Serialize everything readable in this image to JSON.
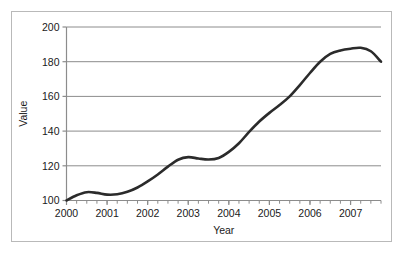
{
  "chart_data": {
    "type": "line",
    "title": "",
    "xlabel": "Year",
    "ylabel": "Value",
    "xlim": [
      2000,
      2007.75
    ],
    "ylim": [
      100,
      200
    ],
    "grid": true,
    "legend": false,
    "line_color": "#2b2b2b",
    "grid_color": "#8c8c8c",
    "axis_color": "#8c8c8c",
    "frame_color": "#b9b9b9",
    "background": "#ffffff",
    "y_ticks": [
      100,
      120,
      140,
      160,
      180,
      200
    ],
    "y_tick_labels": [
      "100",
      "120",
      "140",
      "160",
      "180",
      "200"
    ],
    "x_ticks": [
      2000,
      2001,
      2002,
      2003,
      2004,
      2005,
      2006,
      2007
    ],
    "x_tick_labels": [
      "2000",
      "2001",
      "2002",
      "2003",
      "2004",
      "2005",
      "2006",
      "2007"
    ],
    "x_minor_tick_interval": 0.25,
    "series": [
      {
        "name": "Value",
        "x": [
          2000.0,
          2000.25,
          2000.5,
          2000.75,
          2001.0,
          2001.25,
          2001.5,
          2001.75,
          2002.0,
          2002.25,
          2002.5,
          2002.75,
          2003.0,
          2003.25,
          2003.5,
          2003.75,
          2004.0,
          2004.25,
          2004.5,
          2004.75,
          2005.0,
          2005.25,
          2005.5,
          2005.75,
          2006.0,
          2006.25,
          2006.5,
          2006.75,
          2007.0,
          2007.25,
          2007.5,
          2007.75
        ],
        "values": [
          100.0,
          103.0,
          104.8,
          104.4,
          103.4,
          103.6,
          105.0,
          107.5,
          111.0,
          115.0,
          119.5,
          123.5,
          125.0,
          124.2,
          123.6,
          124.5,
          128.0,
          133.0,
          139.5,
          145.5,
          150.5,
          155.0,
          160.0,
          166.5,
          173.5,
          180.0,
          184.5,
          186.5,
          187.5,
          188.0,
          186.0,
          180.0
        ]
      }
    ]
  }
}
